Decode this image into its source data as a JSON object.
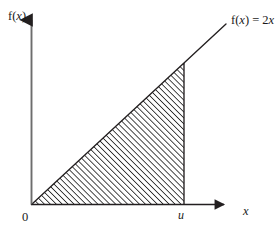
{
  "figure": {
    "kind": "math-plot",
    "background_color": "#ffffff",
    "ink_color": "#231f20",
    "hatch_color": "#2b2b2b",
    "labels": {
      "y_axis": "f(x)",
      "x_axis": "x",
      "origin": "0",
      "upper_limit": "u",
      "function": "f(x) = 2x",
      "function_name": "f",
      "function_arg": "x",
      "function_slope": "2"
    }
  },
  "chart_data": {
    "type": "area",
    "title": "",
    "subtitle": "",
    "xlabel": "x",
    "ylabel": "f(x)",
    "function_label": "f(x) = 2x",
    "function_expression": "2x",
    "slope": 2,
    "intercept": 0,
    "grid": false,
    "legend": "none",
    "axis_arrows": true,
    "xlim": [
      0,
      2.55
    ],
    "ylim": [
      0,
      4.2
    ],
    "x": [
      0,
      2.0
    ],
    "y": [
      0,
      4.0
    ],
    "series": [
      {
        "name": "f(x) = 2x",
        "values": [
          0,
          4.0
        ],
        "style": "line"
      }
    ],
    "shaded_region": {
      "label": "area under f(x) from 0 to u",
      "fill": "diagonal-hatch",
      "x_from": 0,
      "x_to": 2.0,
      "vertices": [
        [
          0,
          0
        ],
        [
          2.0,
          0
        ],
        [
          2.0,
          4.0
        ]
      ],
      "area": 4.0
    },
    "tick_labels": {
      "x": [
        "0",
        "u"
      ],
      "y": []
    },
    "annotations": [
      {
        "text": "f(x) = 2x",
        "position": "upper-right",
        "x": 2.55,
        "y": 4.1
      },
      {
        "text": "u",
        "position": "x-axis-tick",
        "x": 2.0,
        "y": 0
      },
      {
        "text": "0",
        "position": "origin",
        "x": 0,
        "y": 0
      }
    ]
  }
}
